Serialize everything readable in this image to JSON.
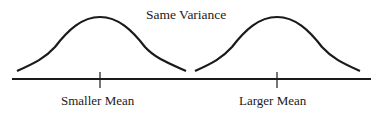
{
  "title": "Same Variance",
  "curves": [
    {
      "label": "Smaller Mean",
      "mean_x": 100,
      "start_x": 17,
      "end_x": 186
    },
    {
      "label": "Larger Mean",
      "mean_x": 277,
      "start_x": 195,
      "end_x": 360
    }
  ],
  "colors": {
    "line": "#1a1a1a",
    "background": "#ffffff"
  }
}
